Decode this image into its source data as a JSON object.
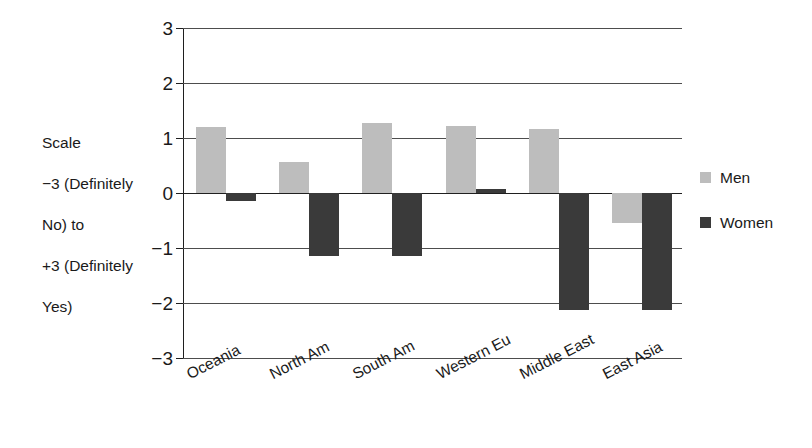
{
  "chart_data": {
    "type": "bar",
    "title": "",
    "subtitle": "",
    "xlabel": "",
    "ylabel": "Scale\n−3  (Definitely No) to\n+3 (Definitely Yes)",
    "ylim": [
      -3,
      3
    ],
    "yticks": [
      3,
      2,
      1,
      0,
      -1,
      -2,
      -3
    ],
    "ytick_labels": [
      "3",
      "2",
      "1",
      "0",
      "−1",
      "−2",
      "−3"
    ],
    "grid": true,
    "legend_position": "right",
    "categories": [
      "Oceania",
      "North Am",
      "South Am",
      "Western Eu",
      "Middle East",
      "East Asia"
    ],
    "series": [
      {
        "name": "Men",
        "color": "#bdbdbd",
        "values": [
          1.2,
          0.57,
          1.27,
          1.22,
          1.17,
          -0.55
        ]
      },
      {
        "name": "Women",
        "color": "#3a3a3a",
        "values": [
          -0.15,
          -1.15,
          -1.15,
          0.08,
          -2.13,
          -2.13
        ]
      }
    ]
  },
  "axis": {
    "label_line_1": "Scale",
    "label_line_2": "−3  (Definitely",
    "label_line_3": "No) to",
    "label_line_4": "+3 (Definitely",
    "label_line_5": "Yes)"
  },
  "legend": {
    "items": [
      {
        "label": "Men",
        "color": "#bdbdbd"
      },
      {
        "label": "Women",
        "color": "#3a3a3a"
      }
    ]
  },
  "colors": {
    "background": "#ffffff",
    "axis": "#1f1f1f",
    "gridline": "#4d4d4d",
    "men": "#bdbdbd",
    "women": "#3a3a3a"
  }
}
